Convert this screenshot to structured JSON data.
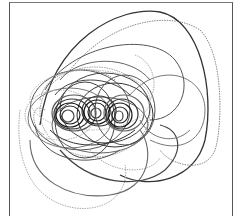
{
  "figure": {
    "stroke_colors": [
      "#222222",
      "#444444",
      "#666666",
      "#999999",
      "#bbbbbb"
    ],
    "cluster_centers": [
      [
        70,
        115
      ],
      [
        95,
        112
      ],
      [
        120,
        115
      ]
    ],
    "background": "#ffffff",
    "frame_color": "#555555"
  }
}
